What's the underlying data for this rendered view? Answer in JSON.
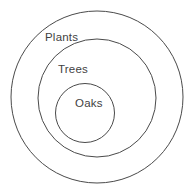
{
  "diagram": {
    "kind": "nested-set-euler-diagram",
    "background_color": "#ffffff",
    "stroke_color": "#4a4a4a",
    "text_color": "#3f3f3f",
    "canvas": {
      "width": 195,
      "height": 193
    },
    "sets": [
      {
        "id": "plants",
        "label": "Plants",
        "level": 1,
        "center_x": 97,
        "center_y": 97,
        "radius": 86,
        "label_x": 45,
        "label_y": 32
      },
      {
        "id": "trees",
        "label": "Trees",
        "level": 2,
        "center_x": 97,
        "center_y": 98,
        "radius": 59,
        "label_x": 58,
        "label_y": 64
      },
      {
        "id": "oaks",
        "label": "Oaks",
        "level": 3,
        "center_x": 85,
        "center_y": 113,
        "radius": 29.5,
        "label_x": 75,
        "label_y": 98
      }
    ]
  }
}
